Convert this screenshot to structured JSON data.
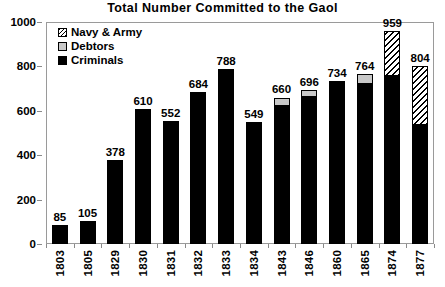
{
  "chart_data": {
    "type": "bar",
    "title": "Total Number Committed to the Gaol",
    "xlabel": "",
    "ylabel": "",
    "ylim": [
      0,
      1000
    ],
    "yticks": [
      0,
      200,
      400,
      600,
      800,
      1000
    ],
    "grid": false,
    "stacked": true,
    "legend_position": "top-left",
    "categories": [
      "1803",
      "1805",
      "1829",
      "1830",
      "1831",
      "1832",
      "1833",
      "1834",
      "1843",
      "1846",
      "1860",
      "1865",
      "1874",
      "1877"
    ],
    "totals": [
      85,
      105,
      378,
      610,
      552,
      684,
      788,
      549,
      660,
      696,
      734,
      764,
      959,
      804
    ],
    "series": [
      {
        "name": "Criminals",
        "color": "#000000",
        "pattern": "solid",
        "values": [
          85,
          105,
          378,
          610,
          552,
          684,
          788,
          549,
          620,
          660,
          734,
          722,
          757,
          536
        ]
      },
      {
        "name": "Debtors",
        "color": "#c8c8c8",
        "pattern": "solid-light",
        "values": [
          0,
          0,
          0,
          0,
          0,
          0,
          0,
          0,
          40,
          36,
          0,
          42,
          0,
          0
        ]
      },
      {
        "name": "Navy & Army",
        "color": "#ffffff",
        "pattern": "diagonal-hatch",
        "values": [
          0,
          0,
          0,
          0,
          0,
          0,
          0,
          0,
          0,
          0,
          0,
          0,
          202,
          268
        ]
      }
    ],
    "data_labels": [
      "85",
      "105",
      "378",
      "610",
      "552",
      "684",
      "788",
      "549",
      "660",
      "696",
      "734",
      "764",
      "959",
      "804"
    ]
  },
  "legend": {
    "items": [
      {
        "label": "Navy & Army",
        "swatch": "hatch-swatch-icon"
      },
      {
        "label": "Debtors",
        "swatch": "gray-swatch-icon"
      },
      {
        "label": "Criminals",
        "swatch": "black-swatch-icon"
      }
    ]
  }
}
